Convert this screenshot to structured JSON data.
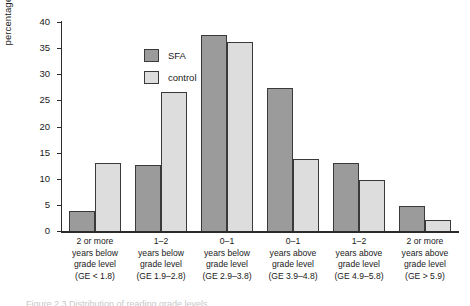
{
  "chart_data": {
    "type": "bar",
    "title": "",
    "xlabel": "",
    "ylabel": "percentage of students",
    "ylim": [
      0,
      40
    ],
    "yticks": [
      0,
      5,
      10,
      15,
      20,
      25,
      30,
      35,
      40
    ],
    "grid": false,
    "legend_position": "top-left inside plot",
    "categories": [
      "2 or more years below grade level (GE < 1.8)",
      "1–2 years below grade level (GE 1.9–2.8)",
      "0–1 years below grade level (GE 2.9–3.8)",
      "0–1 years above grade level (GE 3.9–4.8)",
      "1–2 years above grade level (GE 4.9–5.8)",
      "2 or more years above grade level (GE > 5.9)"
    ],
    "category_lines": [
      [
        "2 or more",
        "years below",
        "grade level",
        "(GE < 1.8)"
      ],
      [
        "1–2",
        "years below",
        "grade level",
        "(GE 1.9–2.8)"
      ],
      [
        "0–1",
        "years below",
        "grade level",
        "(GE 2.9–3.8)"
      ],
      [
        "0–1",
        "years above",
        "grade level",
        "(GE 3.9–4.8)"
      ],
      [
        "1–2",
        "years above",
        "grade level",
        "(GE 4.9–5.8)"
      ],
      [
        "2 or more",
        "years above",
        "grade level",
        "(GE > 5.9)"
      ]
    ],
    "series": [
      {
        "name": "SFA",
        "color": "#9b9b9b",
        "values": [
          3.8,
          12.7,
          37.6,
          27.3,
          13.0,
          4.7
        ]
      },
      {
        "name": "control",
        "color": "#dddddd",
        "values": [
          13.1,
          26.6,
          36.2,
          13.7,
          9.8,
          2.2
        ]
      }
    ]
  },
  "legend": {
    "items": [
      {
        "label": "SFA"
      },
      {
        "label": "control"
      }
    ]
  },
  "caption": {
    "sliver_text": "Figure 2.3  Distribution of reading grade levels"
  }
}
